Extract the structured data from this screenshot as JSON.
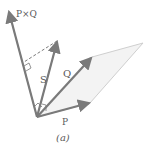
{
  "figure": {
    "caption": "(a)",
    "vectors": [
      {
        "id": "P",
        "label": "P",
        "from": [
          37,
          117
        ],
        "to": [
          90,
          103
        ]
      },
      {
        "id": "Q",
        "label": "Q",
        "from": [
          37,
          117
        ],
        "to": [
          92,
          57
        ]
      },
      {
        "id": "S",
        "label": "S",
        "from": [
          37,
          117
        ],
        "to": [
          57,
          41
        ]
      },
      {
        "id": "PxQ",
        "label": "P×Q",
        "from": [
          37,
          117
        ],
        "to": [
          9,
          11
        ]
      }
    ],
    "parallelogram": [
      [
        37,
        117
      ],
      [
        90,
        103
      ],
      [
        143,
        43
      ],
      [
        92,
        57
      ]
    ],
    "projection": {
      "style": "dashed",
      "from": [
        57,
        41
      ],
      "to": [
        24,
        62
      ]
    },
    "colors": {
      "vector": "#7a7a7a",
      "parallelogram_fill": "#f3f3f3",
      "parallelogram_edge": "#cfcfcf",
      "text": "#5a5a5a"
    }
  }
}
